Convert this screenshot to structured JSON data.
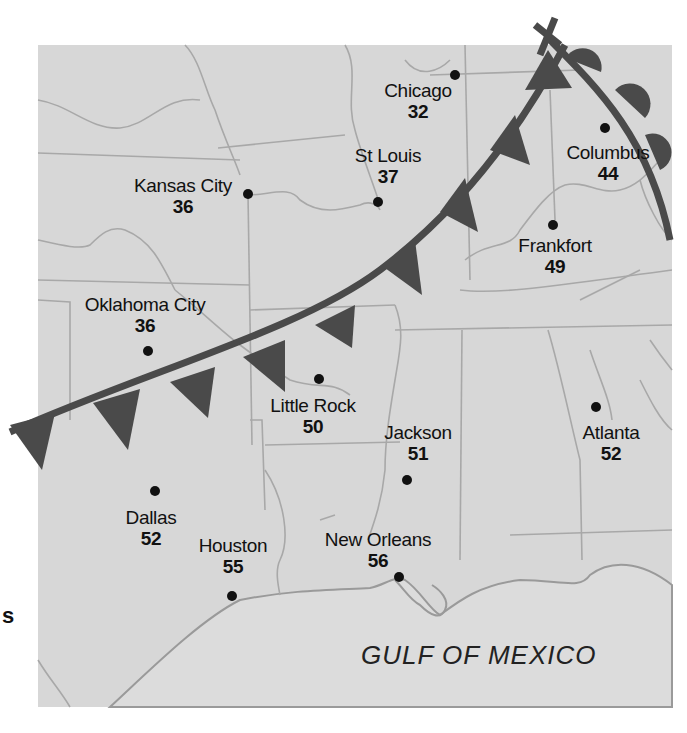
{
  "map": {
    "type": "weather-front-map",
    "background_color": "#d7d7d7",
    "water_color": "#dcdcdc",
    "front_color": "#4a4a4a",
    "water_label": "GULF OF MEXICO",
    "edge_fragment": "s"
  },
  "front": {
    "cold_front_triangles": 8,
    "warm_front_semicircles": 3
  },
  "cities": [
    {
      "name": "Chicago",
      "temp": "32"
    },
    {
      "name": "St Louis",
      "temp": "37"
    },
    {
      "name": "Kansas City",
      "temp": "36"
    },
    {
      "name": "Columbus",
      "temp": "44"
    },
    {
      "name": "Frankfort",
      "temp": "49"
    },
    {
      "name": "Oklahoma City",
      "temp": "36"
    },
    {
      "name": "Little Rock",
      "temp": "50"
    },
    {
      "name": "Jackson",
      "temp": "51"
    },
    {
      "name": "Atlanta",
      "temp": "52"
    },
    {
      "name": "Dallas",
      "temp": "52"
    },
    {
      "name": "Houston",
      "temp": "55"
    },
    {
      "name": "New Orleans",
      "temp": "56"
    }
  ]
}
